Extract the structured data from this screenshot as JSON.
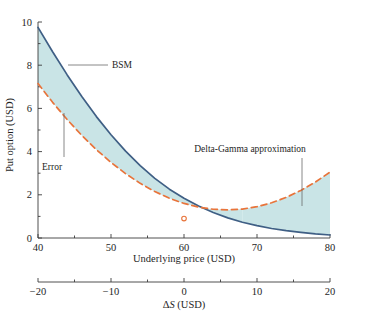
{
  "figure": {
    "background": "#ffffff",
    "bsm_color": "#3f5f85",
    "dg_color": "#e8743b",
    "fill_color": "#bfdfe2",
    "axis_color": "#3c3c3c",
    "leader_color": "#6b6b6b",
    "marker_label": "at-the-money-marker"
  },
  "chart_data": {
    "type": "line",
    "title": "",
    "xlabel": "Underlying price (USD)",
    "ylabel": "Put option (USD)",
    "xlim": [
      40,
      80
    ],
    "ylim": [
      0,
      10
    ],
    "grid": false,
    "legend_position": "inline-annotations",
    "x_ticks": [
      "40",
      "50",
      "60",
      "70",
      "80"
    ],
    "x_tick_values": [
      40,
      50,
      60,
      70,
      80
    ],
    "x_minor_tick_values": [
      45,
      55,
      65,
      75
    ],
    "y_ticks": [
      "0",
      "2",
      "4",
      "6",
      "8",
      "10"
    ],
    "y_tick_values": [
      0,
      2,
      4,
      6,
      8,
      10
    ],
    "y_minor_tick_values": [
      1,
      3,
      5,
      7,
      9
    ],
    "secondary_axis": {
      "label": "ΔS (USD)",
      "label_delta": "Δ",
      "label_s": "S",
      "label_units": " (USD)",
      "lim": [
        -20,
        20
      ],
      "ticks": [
        "−20",
        "−10",
        "0",
        "10",
        "20"
      ],
      "tick_values": [
        -20,
        -10,
        0,
        10,
        20
      ],
      "minor_tick_values": [
        -15,
        -5,
        5,
        15
      ]
    },
    "series": [
      {
        "name": "BSM",
        "style": "solid",
        "color": "#3f5f85",
        "x": [
          40,
          42,
          44,
          46,
          48,
          50,
          52,
          54,
          56,
          58,
          60,
          62,
          64,
          66,
          68,
          70,
          72,
          74,
          76,
          78,
          80
        ],
        "values": [
          9.75,
          8.62,
          7.55,
          6.55,
          5.62,
          4.78,
          4.02,
          3.35,
          2.76,
          2.26,
          1.84,
          1.48,
          1.18,
          0.93,
          0.73,
          0.57,
          0.44,
          0.34,
          0.26,
          0.19,
          0.14
        ]
      },
      {
        "name": "Delta-Gamma approximation",
        "style": "dashed",
        "color": "#e8743b",
        "x": [
          40,
          42,
          44,
          46,
          48,
          50,
          52,
          54,
          56,
          58,
          60,
          62,
          64,
          66,
          68,
          70,
          72,
          74,
          76,
          78,
          80
        ],
        "values": [
          7.15,
          6.28,
          5.48,
          4.75,
          4.09,
          3.5,
          2.98,
          2.53,
          2.15,
          1.84,
          1.6,
          1.43,
          1.33,
          1.3,
          1.34,
          1.45,
          1.63,
          1.88,
          2.2,
          2.59,
          3.05
        ]
      }
    ],
    "shaded_regions": [
      {
        "name": "error-region-left",
        "x_from": 40,
        "x_to": 68,
        "between": [
          "BSM",
          "Delta-Gamma approximation"
        ]
      },
      {
        "name": "error-region-right",
        "x_from": 68,
        "x_to": 80,
        "between": [
          "Delta-Gamma approximation",
          "BSM"
        ]
      }
    ],
    "markers": [
      {
        "name": "strike-marker",
        "x": 60,
        "y": 0.9,
        "shape": "circle",
        "color": "#e8743b"
      }
    ],
    "annotations": [
      {
        "name": "bsm-label",
        "text": "BSM",
        "x": 112,
        "y": 68,
        "leader_from": [
          108,
          65
        ],
        "leader_to": [
          68,
          65
        ]
      },
      {
        "name": "error-label",
        "text": "Error",
        "x": 42,
        "y": 170,
        "leader_from": [
          64,
          157
        ],
        "leader_to": [
          64,
          113
        ]
      },
      {
        "name": "delta-gamma-label",
        "text": "Delta-Gamma approximation",
        "x": 250,
        "y": 152,
        "leader_from": [
          302,
          158
        ],
        "leader_to": [
          302,
          206
        ]
      }
    ]
  }
}
